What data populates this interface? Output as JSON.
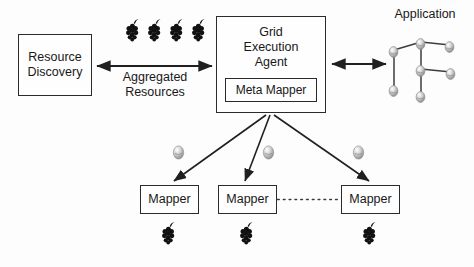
{
  "diagram": {
    "background_color": "#fdfdfd",
    "stroke_color": "#2b2b2b",
    "text_color": "#181818",
    "grape_color": "#111111",
    "sphere_color": "#b9b9b9"
  },
  "boxes": {
    "resource_discovery": {
      "label": "Resource\nDiscovery"
    },
    "grid_execution_agent": {
      "label": "Grid\nExecution\nAgent"
    },
    "meta_mapper": {
      "label": "Meta Mapper"
    },
    "mappers": [
      {
        "label": "Mapper"
      },
      {
        "label": "Mapper"
      },
      {
        "label": "Mapper"
      }
    ]
  },
  "labels": {
    "aggregated_resources": "Aggregated\nResources",
    "application": "Application"
  },
  "connectors": {
    "aggregated_resources_arrow": {
      "type": "double-arrow",
      "from": "resource_discovery",
      "to": "grid_execution_agent"
    },
    "application_arrow": {
      "type": "double-arrow",
      "from": "grid_execution_agent",
      "to": "application_graph"
    },
    "agent_to_mappers": {
      "type": "arrow",
      "count": 3,
      "from": "grid_execution_agent",
      "to": "mappers"
    },
    "mapper_ellipsis": {
      "type": "dotted-line",
      "between": [
        "mapper-2",
        "mapper-3"
      ]
    }
  },
  "icons": {
    "top_grapes_count": 4,
    "mapper_grapes_count": 3,
    "mapper_spheres_count": 3,
    "application_nodes_count": 7
  }
}
